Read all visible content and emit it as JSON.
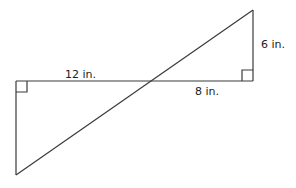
{
  "diagram": {
    "type": "similar-right-triangles",
    "colors": {
      "stroke": "#3a3a3a",
      "text": "#222222",
      "background": "#ffffff"
    },
    "labels": {
      "left_segment": "12 in.",
      "right_segment": "8 in.",
      "right_height": "6 in."
    },
    "vertices": {
      "left_top": [
        16,
        81
      ],
      "left_bottom": [
        16,
        175
      ],
      "right_bottom": [
        253,
        81
      ],
      "right_top": [
        253,
        10
      ],
      "intersection": [
        152,
        81
      ]
    },
    "right_angle_markers": [
      "left_top",
      "right_bottom"
    ]
  }
}
